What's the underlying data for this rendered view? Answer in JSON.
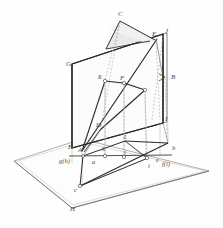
{
  "figure": {
    "type": "technical-line-drawing",
    "colors": {
      "line_dark": "#2b2b2b",
      "line_medium": "#5a5a5a",
      "line_light": "#9a9a9a",
      "line_hidden": "#b0b0b0",
      "plane_fill": "#fbfbfb",
      "shade_fill": "#e8e8e8",
      "label_color": "#4a4a4a",
      "background": "#fefefe"
    },
    "planes": {
      "vertical_plane_label": "V",
      "horizontal_plane_label": "H",
      "ground_line_label": "g(h)"
    },
    "labels_uppercase": [
      {
        "text": "C",
        "x": 118,
        "y": 11,
        "class": "lbl-upper"
      },
      {
        "text": "E",
        "x": 152,
        "y": 31,
        "class": "lbl-upper"
      },
      {
        "text": "J",
        "x": 165,
        "y": 28,
        "class": "lbl-upper"
      },
      {
        "text": "G",
        "x": 66,
        "y": 61,
        "class": "lbl-upper"
      },
      {
        "text": "B",
        "x": 171,
        "y": 74,
        "class": "lbl-upper"
      },
      {
        "text": "K",
        "x": 98,
        "y": 74,
        "class": "lbl-small"
      },
      {
        "text": "F",
        "x": 120,
        "y": 75,
        "class": "lbl-upper"
      },
      {
        "text": "I",
        "x": 165,
        "y": 116,
        "class": "lbl-upper"
      },
      {
        "text": "D",
        "x": 96,
        "y": 122,
        "class": "lbl-upper"
      },
      {
        "text": "H",
        "x": 68,
        "y": 144,
        "class": "lbl-upper"
      },
      {
        "text": "A",
        "x": 78,
        "y": 147,
        "class": "lbl-upper"
      },
      {
        "text": "L",
        "x": 124,
        "y": 137,
        "class": "lbl-small"
      },
      {
        "text": "H",
        "x": 70,
        "y": 208,
        "class": "lbl-upper"
      }
    ],
    "labels_lowercase": [
      {
        "text": "g(h)",
        "x": 61,
        "y": 159,
        "class": "lbl-lower"
      },
      {
        "text": "a",
        "x": 92,
        "y": 161,
        "class": "lbl-lower"
      },
      {
        "text": "k",
        "x": 103,
        "y": 148,
        "class": "lbl-lower"
      },
      {
        "text": "l",
        "x": 124,
        "y": 152,
        "class": "lbl-lower"
      },
      {
        "text": "i",
        "x": 148,
        "y": 164,
        "class": "lbl-lower"
      },
      {
        "text": "e",
        "x": 156,
        "y": 158,
        "class": "lbl-lower"
      },
      {
        "text": "f(l)",
        "x": 162,
        "y": 162,
        "class": "lbl-lower"
      },
      {
        "text": "b",
        "x": 172,
        "y": 147,
        "class": "lbl-lower"
      },
      {
        "text": "c",
        "x": 79,
        "y": 189,
        "class": "lbl-lower"
      }
    ],
    "vertices": {
      "plane_v": {
        "G": [
          72,
          64
        ],
        "J": [
          163,
          34
        ],
        "I": [
          163,
          123
        ],
        "H": [
          72,
          148
        ]
      },
      "points_upper": {
        "C": [
          120,
          19
        ],
        "E": [
          156,
          38
        ],
        "K": [
          104,
          79
        ],
        "F": [
          124,
          81
        ],
        "M": [
          145,
          89
        ],
        "D": [
          101,
          127
        ],
        "B": [
          165,
          77
        ],
        "A": [
          82,
          152
        ]
      },
      "points_lower": {
        "a": [
          83,
          156
        ],
        "k": [
          105,
          156
        ],
        "l": [
          125,
          157
        ],
        "i": [
          148,
          158
        ],
        "b": [
          168,
          142
        ],
        "c": [
          80,
          184
        ],
        "L": [
          125,
          141
        ],
        "f": [
          160,
          157
        ]
      },
      "ground_plane": {
        "left": [
          14,
          160
        ],
        "top": [
          80,
          141
        ],
        "right": [
          207,
          172
        ],
        "bottom": [
          72,
          207
        ]
      }
    }
  }
}
